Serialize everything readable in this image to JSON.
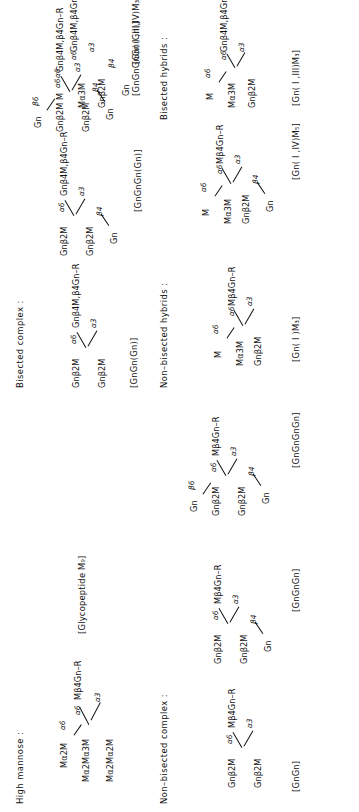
{
  "figure": {
    "orientation_deg": -90,
    "ink_color": "#111111",
    "background_color": "#ffffff"
  },
  "sections": [
    {
      "id": "high-mannose",
      "title": "High mannose :",
      "bracket": "[Glycopeptide M₉]",
      "nodes": [
        {
          "id": "hm-n1",
          "text": "Mα2M"
        },
        {
          "id": "hm-n2",
          "text": "Mα2Mα3M"
        },
        {
          "id": "hm-core",
          "text": "Mβ4Gn–R"
        },
        {
          "id": "hm-n3",
          "text": "Mα2Mα2M"
        }
      ],
      "links": [
        {
          "id": "hm-l1",
          "text": "α6"
        },
        {
          "id": "hm-l2",
          "text": "α6"
        },
        {
          "id": "hm-l3",
          "text": "α3"
        }
      ]
    },
    {
      "id": "non-bisected-complex",
      "title": "Non–bisected complex :",
      "structures": [
        {
          "id": "gngn",
          "bracket": "[GnGn]",
          "nodes": [
            {
              "id": "gngn-a",
              "text": "Gnβ2M"
            },
            {
              "id": "gngn-core",
              "text": "Mβ4Gn–R"
            },
            {
              "id": "gngn-b",
              "text": "Gnβ2M"
            }
          ],
          "links": [
            {
              "id": "gngn-l1",
              "text": "α6"
            },
            {
              "id": "gngn-l2",
              "text": "α3"
            }
          ]
        },
        {
          "id": "gngngn",
          "bracket": "[GnGnGn]",
          "nodes": [
            {
              "id": "gngngn-a",
              "text": "Gnβ2M"
            },
            {
              "id": "gngngn-core",
              "text": "Mβ4Gn–R"
            },
            {
              "id": "gngngn-b",
              "text": "Gnβ2M"
            },
            {
              "id": "gngngn-c",
              "text": "Gn"
            }
          ],
          "links": [
            {
              "id": "gngngn-l1",
              "text": "α6"
            },
            {
              "id": "gngngn-l2",
              "text": "α3"
            },
            {
              "id": "gngngn-l3",
              "text": "β4"
            }
          ]
        },
        {
          "id": "gngngngn",
          "bracket": "[GnGnGnGn]",
          "nodes": [
            {
              "id": "gngngngn-z",
              "text": "Gn"
            },
            {
              "id": "gngngngn-a",
              "text": "Gnβ2M"
            },
            {
              "id": "gngngngn-core",
              "text": "Mβ4Gn–R"
            },
            {
              "id": "gngngngn-b",
              "text": "Gnβ2M"
            },
            {
              "id": "gngngngn-c",
              "text": "Gn"
            }
          ],
          "links": [
            {
              "id": "gngngngn-l0",
              "text": "β6"
            },
            {
              "id": "gngngngn-l1",
              "text": "α6"
            },
            {
              "id": "gngngngn-l2",
              "text": "α3"
            },
            {
              "id": "gngngngn-l3",
              "text": "β4"
            }
          ]
        }
      ]
    },
    {
      "id": "bisected-complex",
      "title": "Bisected complex :",
      "structures": [
        {
          "id": "gngn-gn",
          "bracket": "[GnGn(Gn)]",
          "nodes": [
            {
              "id": "bgngn-a",
              "text": "Gnβ2M"
            },
            {
              "id": "bgngn-core",
              "text": "Gnβ4M,β4Gn–R"
            },
            {
              "id": "bgngn-b",
              "text": "Gnβ2M"
            }
          ],
          "links": [
            {
              "id": "bgngn-l1",
              "text": "α6"
            },
            {
              "id": "bgngn-l2",
              "text": "α3"
            }
          ]
        },
        {
          "id": "gngngn-gn",
          "bracket": "[GnGnGn(Gn)]",
          "nodes": [
            {
              "id": "bgngngn-a",
              "text": "Gnβ2M"
            },
            {
              "id": "bgngngn-core",
              "text": "Gnβ4M,β4Gn–R"
            },
            {
              "id": "bgngngn-b",
              "text": "Gnβ2M"
            },
            {
              "id": "bgngngn-c",
              "text": "Gn"
            }
          ],
          "links": [
            {
              "id": "bgngngn-l1",
              "text": "α6"
            },
            {
              "id": "bgngngn-l2",
              "text": "α3"
            },
            {
              "id": "bgngngn-l3",
              "text": "β4"
            }
          ]
        },
        {
          "id": "gngngngn-gn",
          "bracket": "[GnGnGnGn(Gn)]",
          "nodes": [
            {
              "id": "bgngngngn-z",
              "text": "Gn"
            },
            {
              "id": "bgngngngn-a",
              "text": "Gnβ2M"
            },
            {
              "id": "bgngngngn-core",
              "text": "Gnβ4M,β4Gn–R"
            },
            {
              "id": "bgngngngn-b",
              "text": "Gnβ2M"
            },
            {
              "id": "bgngngngn-c",
              "text": "Gn"
            }
          ],
          "links": [
            {
              "id": "bgngngngn-l0",
              "text": "β6"
            },
            {
              "id": "bgngngngn-l1",
              "text": "α6"
            },
            {
              "id": "bgngngngn-l2",
              "text": "α3"
            },
            {
              "id": "bgngngngn-l3",
              "text": "β4"
            }
          ]
        }
      ]
    },
    {
      "id": "non-bisected-hybrids",
      "title": "Non–bisected hybrids :",
      "structures": [
        {
          "id": "gn1m3",
          "bracket": "[Gn( I )M₃]",
          "nodes": [
            {
              "id": "nbh1-t",
              "text": "M"
            },
            {
              "id": "nbh1-m",
              "text": "Mα3M"
            },
            {
              "id": "nbh1-core",
              "text": "Mβ4Gn–R"
            },
            {
              "id": "nbh1-b",
              "text": "Gnβ2M"
            }
          ],
          "links": [
            {
              "id": "nbh1-l0",
              "text": "α6"
            },
            {
              "id": "nbh1-l1",
              "text": "α6"
            },
            {
              "id": "nbh1-l2",
              "text": "α3"
            }
          ]
        },
        {
          "id": "gn1iv-m5",
          "bracket": "[Gn( I ,IV)M₅]",
          "nodes": [
            {
              "id": "nbh2-t",
              "text": "M"
            },
            {
              "id": "nbh2-m",
              "text": "Mα3M"
            },
            {
              "id": "nbh2-core",
              "text": "Mβ4Gn–R"
            },
            {
              "id": "nbh2-b",
              "text": "Gnβ2M"
            },
            {
              "id": "nbh2-c",
              "text": "Gn"
            }
          ],
          "links": [
            {
              "id": "nbh2-l0",
              "text": "α6"
            },
            {
              "id": "nbh2-l1",
              "text": "α6"
            },
            {
              "id": "nbh2-l2",
              "text": "α3"
            },
            {
              "id": "nbh2-l3",
              "text": "β4"
            }
          ]
        }
      ]
    },
    {
      "id": "bisected-hybrids",
      "title": "Bisected hybrids :",
      "structures": [
        {
          "id": "gn1iii-m3",
          "bracket": "[Gn( I ,III)M₃]",
          "nodes": [
            {
              "id": "bh1-t",
              "text": "M"
            },
            {
              "id": "bh1-m",
              "text": "Mα3M"
            },
            {
              "id": "bh1-core",
              "text": "Gnβ4M,β4Gn–R"
            },
            {
              "id": "bh1-b",
              "text": "Gnβ2M"
            }
          ],
          "links": [
            {
              "id": "bh1-l0",
              "text": "α6"
            },
            {
              "id": "bh1-l1",
              "text": "α6"
            },
            {
              "id": "bh1-l2",
              "text": "α3"
            }
          ]
        },
        {
          "id": "gn1iiiiv-m3",
          "bracket": "[Gn( I ,III,IV)M₃]",
          "nodes": [
            {
              "id": "bh2-t",
              "text": "M"
            },
            {
              "id": "bh2-m",
              "text": "Mα3M"
            },
            {
              "id": "bh2-core",
              "text": "Gnβ4M,β4Gn–R"
            },
            {
              "id": "bh2-b",
              "text": "Gnβ2M"
            },
            {
              "id": "bh2-c",
              "text": "Gn"
            }
          ],
          "links": [
            {
              "id": "bh2-l0",
              "text": "α6"
            },
            {
              "id": "bh2-l1",
              "text": "α6"
            },
            {
              "id": "bh2-l2",
              "text": "α3"
            },
            {
              "id": "bh2-l3",
              "text": "β4"
            }
          ]
        }
      ]
    }
  ]
}
